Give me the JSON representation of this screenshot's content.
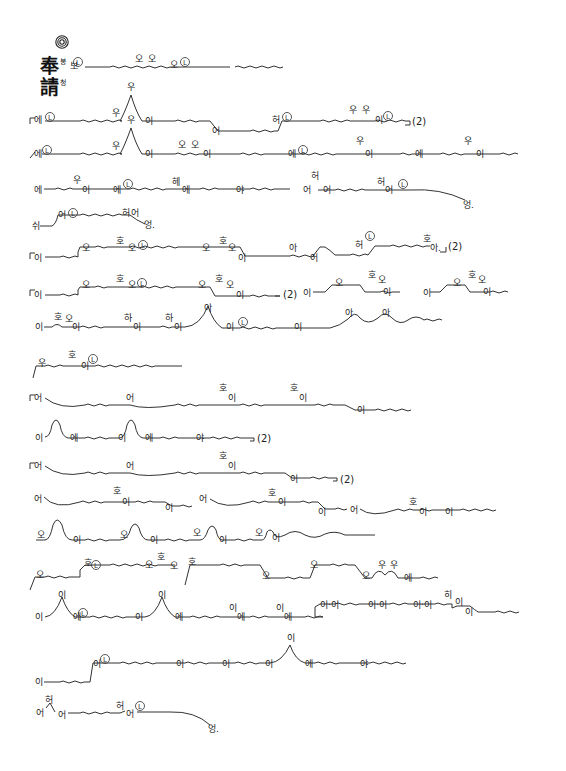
{
  "document": {
    "title_hanja": [
      "奉",
      "請"
    ],
    "title_hangul": [
      "봉",
      "청"
    ],
    "header_symbol": "concentric-circle-mark",
    "repeat_marker": "(2)",
    "breath_mark": "L",
    "lines": [
      {
        "id": 1,
        "y": 62,
        "syllables": [
          "보",
          "오",
          "오",
          "오"
        ],
        "has_L": 2
      },
      {
        "id": 2,
        "y": 120,
        "syllables": [
          "에",
          "우",
          "우",
          "이",
          "어",
          "허",
          "우",
          "우",
          "이"
        ],
        "repeat": "(2)",
        "has_L": 3
      },
      {
        "id": 3,
        "y": 153,
        "syllables": [
          "에",
          "우",
          "우",
          "이",
          "오",
          "오",
          "이",
          "에",
          "우",
          "이",
          "에",
          "우",
          "이"
        ],
        "has_L": 2
      },
      {
        "id": 4,
        "y": 190,
        "syllables": [
          "에",
          "우",
          "이",
          "에",
          "헤",
          "에",
          "야",
          "어",
          "허",
          "어",
          "허",
          "어",
          "엉."
        ],
        "has_L": 2
      },
      {
        "id": 5,
        "y": 225,
        "syllables": [
          "쉬",
          "어",
          "허",
          "어",
          "엉."
        ],
        "has_L": 1
      },
      {
        "id": 6,
        "y": 256,
        "syllables": [
          "이",
          "오",
          "호",
          "오",
          "오",
          "호",
          "오",
          "이",
          "아",
          "어",
          "허",
          "호",
          "아."
        ],
        "repeat": "(2)",
        "has_L": 2
      },
      {
        "id": 7,
        "y": 293,
        "syllables": [
          "이",
          "오",
          "호",
          "오",
          "오",
          "호",
          "오",
          "이",
          "이",
          "오",
          "호",
          "오",
          "이",
          "이",
          "오",
          "호",
          "오",
          "이"
        ],
        "repeat": "(2)",
        "has_L": 1
      },
      {
        "id": 8,
        "y": 327,
        "syllables": [
          "이",
          "호",
          "오",
          "이",
          "하",
          "이",
          "하",
          "이",
          "아",
          "이",
          "이",
          "아",
          "아"
        ],
        "has_L": 1
      },
      {
        "id": 9,
        "y": 366,
        "syllables": [
          "우",
          "호",
          "이"
        ],
        "has_L": 1
      },
      {
        "id": 10,
        "y": 398,
        "syllables": [
          "어",
          "어",
          "호",
          "이",
          "호",
          "이",
          "이"
        ]
      },
      {
        "id": 11,
        "y": 438,
        "syllables": [
          "이",
          "에",
          "이",
          "에",
          "야"
        ],
        "repeat": "(2)"
      },
      {
        "id": 12,
        "y": 466,
        "syllables": [
          "어",
          "어",
          "호",
          "이",
          "이"
        ],
        "repeat": "(2)"
      },
      {
        "id": 13,
        "y": 500,
        "syllables": [
          "어",
          "호",
          "이",
          "이",
          "어",
          "호",
          "이",
          "이",
          "어",
          "호",
          "이",
          "이"
        ]
      },
      {
        "id": 14,
        "y": 536,
        "syllables": [
          "오",
          "이",
          "오",
          "이",
          "오",
          "이",
          "오",
          "이"
        ]
      },
      {
        "id": 15,
        "y": 574,
        "syllables": [
          "오",
          "호",
          "호",
          "오",
          "오",
          "호",
          "오",
          "오",
          "오",
          "우",
          "우",
          "에"
        ],
        "has_L": 1
      },
      {
        "id": 16,
        "y": 615,
        "syllables": [
          "이",
          "이",
          "에",
          "이",
          "이",
          "에",
          "이",
          "에",
          "이",
          "에",
          "이·이",
          "이·이",
          "이·이",
          "히",
          "이",
          "이"
        ],
        "has_L": 1
      },
      {
        "id": 17,
        "y": 665,
        "syllables": [
          "이",
          "이",
          "이",
          "이",
          "이",
          "이",
          "에",
          "야"
        ],
        "has_L": 1
      },
      {
        "id": 18,
        "y": 708,
        "syllables": [
          "어",
          "허",
          "어",
          "허",
          "어",
          "엉."
        ],
        "has_L": 1
      }
    ]
  }
}
